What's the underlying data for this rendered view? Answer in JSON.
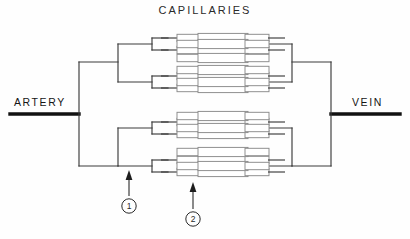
{
  "figure": {
    "type": "diagram",
    "title": "CAPILLARIES",
    "background_color": "#ffffff",
    "line_color": "#333333",
    "thick_vessel_color": "#111111",
    "tube_fill": "#ffffff",
    "tube_stroke": "#8a8a8a"
  },
  "labels": {
    "title": "CAPILLARIES",
    "artery": "ARTERY",
    "vein": "VEIN"
  },
  "callouts": [
    {
      "id": "1",
      "number": "1",
      "target": "arteriole-branch",
      "arrow_direction": "up"
    },
    {
      "id": "2",
      "number": "2",
      "target": "capillary",
      "arrow_direction": "up"
    }
  ],
  "structure": {
    "inlet": {
      "name": "artery",
      "x_start": 10,
      "x_end": 78,
      "y": 114,
      "stroke_width": 3.2
    },
    "outlet": {
      "name": "vein",
      "x_start": 332,
      "x_end": 400,
      "y": 114,
      "stroke_width": 3.2
    },
    "branch_levels": 4,
    "capillary_rows": 16,
    "row_y": [
      46,
      58,
      70,
      82,
      98,
      110,
      122,
      134,
      50,
      62,
      74,
      86,
      102,
      114,
      126,
      138
    ],
    "trunk_x": 78,
    "level1_x": 118,
    "level2_x": 152,
    "level3_x": 172,
    "capillary_x_start": 188,
    "capillary_x_end": 222,
    "mirror_axis_x": 205
  },
  "segments": {
    "arteriole": "arteriole-tube",
    "capillary": "capillary-tube",
    "venule": "venule-tube"
  }
}
